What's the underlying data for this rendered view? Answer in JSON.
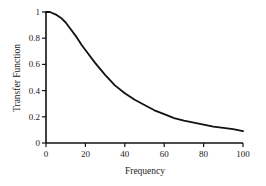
{
  "chart_data": {
    "type": "line",
    "title": "",
    "xlabel": "Frequency",
    "ylabel": "Transfer Function",
    "xlim": [
      0,
      100
    ],
    "ylim": [
      0,
      1
    ],
    "xticks": [
      "0",
      "20",
      "40",
      "60",
      "80",
      "100"
    ],
    "yticks": [
      "0",
      "0.2",
      "0.4",
      "0.6",
      "0.8",
      "1"
    ],
    "grid": false,
    "legend": null,
    "series": [
      {
        "name": "Transfer Function",
        "color": "#111111",
        "x": [
          0,
          2,
          5,
          8,
          10,
          12,
          15,
          18,
          20,
          25,
          30,
          35,
          40,
          45,
          50,
          55,
          60,
          65,
          70,
          75,
          80,
          85,
          90,
          95,
          100
        ],
        "y": [
          1.0,
          1.0,
          0.98,
          0.95,
          0.92,
          0.88,
          0.82,
          0.75,
          0.71,
          0.61,
          0.52,
          0.44,
          0.38,
          0.33,
          0.29,
          0.25,
          0.22,
          0.19,
          0.17,
          0.155,
          0.14,
          0.125,
          0.115,
          0.105,
          0.09
        ]
      }
    ]
  }
}
